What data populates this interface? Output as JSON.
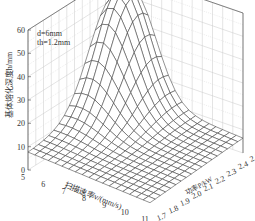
{
  "chart_data": {
    "type": "surface3d",
    "title": "",
    "zlabel": "基体熔化深度h/mm",
    "xlabel": "扫描速率v/(mm/s)",
    "ylabel": "功率P/kW",
    "zlim": [
      0,
      60
    ],
    "z_ticks": [
      "0",
      "10",
      "20",
      "30",
      "40",
      "50",
      "60"
    ],
    "x_ticks": [
      "5",
      "6",
      "7",
      "8",
      "9",
      "10",
      "11"
    ],
    "y_ticks": [
      "1.7",
      "1.8",
      "1.9",
      "2.0",
      "2.1",
      "2.2",
      "2.3",
      "2.4",
      "2.5"
    ],
    "annotations": [
      "d=6mm",
      "th=1.2mm"
    ],
    "x": [
      5,
      6,
      7,
      8,
      9,
      10,
      11
    ],
    "y": [
      1.7,
      1.8,
      1.9,
      2.0,
      2.1,
      2.2,
      2.3,
      2.4,
      2.5
    ],
    "z_description": "Melt depth rises sharply at low scan speed (5-6 mm/s) and high power (2.3-2.5 kW), peaking near 55 mm; it falls to roughly 5-10 mm at high speed and low power.",
    "peak": {
      "x": 5.5,
      "y": 2.45,
      "z": 55
    },
    "grid": true
  },
  "annotation": {
    "line1": "d=6mm",
    "line2": "th=1.2mm"
  }
}
